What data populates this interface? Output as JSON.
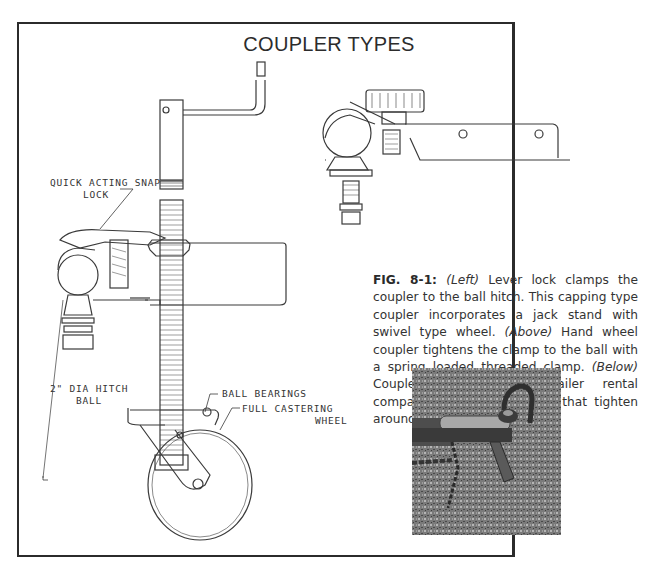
{
  "figure": {
    "title": "COUPLER TYPES",
    "number": "FIG. 8-1:",
    "caption_parts": {
      "left_tag": "(Left)",
      "left_text": " Lever lock clamps the coupler to the ball hitch. This capping type coupler incorporates a jack stand with swivel type wheel. ",
      "above_tag": "(Above)",
      "above_text": " Hand wheel coupler tightens the clamp to the ball with a spring loaded threaded clamp. ",
      "below_tag": "(Below)",
      "below_text": " Coupler popular with trailer rental companies with two sockets that tighten around the ball."
    }
  },
  "labels": {
    "snap_lock_line1": "QUICK ACTING SNAP",
    "snap_lock_line2": "LOCK",
    "hitch_ball_line1": "2\" DIA HITCH",
    "hitch_ball_line2": "BALL",
    "ball_bearings": "BALL BEARINGS",
    "castering_line1": "FULL CASTERING",
    "castering_line2": "WHEEL"
  },
  "colors": {
    "border": "#2b2b2b",
    "ink": "#333333",
    "photo_gray": "#6e6e6e"
  }
}
